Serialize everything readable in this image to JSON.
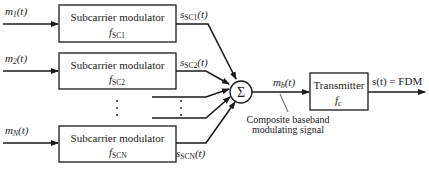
{
  "diagram": {
    "inputs": [
      {
        "label": "m",
        "sub": "1",
        "arg": "(t)"
      },
      {
        "label": "m",
        "sub": "2",
        "arg": "(t)"
      },
      {
        "label": "m",
        "sub": "N",
        "arg": "(t)"
      }
    ],
    "modulators": [
      {
        "title": "Subcarrier modulator",
        "freq": "f",
        "freq_sub": "SC1"
      },
      {
        "title": "Subcarrier modulator",
        "freq": "f",
        "freq_sub": "SC2"
      },
      {
        "title": "Subcarrier modulator",
        "freq": "f",
        "freq_sub": "SCN"
      }
    ],
    "outputs": [
      {
        "label": "s",
        "sub": "SC1",
        "arg": "(t)"
      },
      {
        "label": "s",
        "sub": "SC2",
        "arg": "(t)"
      },
      {
        "label": "s",
        "sub": "SCN",
        "arg": "(t)"
      }
    ],
    "summer": {
      "symbol": "Σ"
    },
    "composite": {
      "label": "m",
      "sub": "b",
      "arg": "(t)",
      "annotation_line1": "Composite baseband",
      "annotation_line2": "modulating signal"
    },
    "transmitter": {
      "title": "Transmitter",
      "freq": "f",
      "freq_sub": "c"
    },
    "final_output": {
      "label": "s(t) = FDM"
    }
  }
}
